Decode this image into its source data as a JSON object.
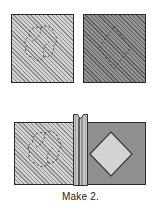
{
  "figure": {
    "caption": "Make 2.",
    "units": [
      {
        "id": "top-left-square",
        "name": "light-hatched-square-with-dashed-blob",
        "fabric": "light-hatched",
        "marking": "dashed-rounded-applique-placement-line",
        "position": {
          "x": 11,
          "y": 14,
          "w": 63,
          "h": 69
        }
      },
      {
        "id": "top-right-square",
        "name": "dark-hatched-square-with-dashed-diamond",
        "fabric": "dark-hatched",
        "marking": "dashed-diamond-placement-line",
        "position": {
          "x": 83,
          "y": 14,
          "w": 63,
          "h": 69
        }
      },
      {
        "id": "joined-unit",
        "name": "joined-two-square-unit-with-center-seam",
        "fabric_left": "light-hatched",
        "fabric_right": "solid-medium-gray",
        "marking_left": "dashed-rounded-applique-placement-line",
        "marking_right": "light-gray-diamond-applique",
        "position": {
          "x": 14,
          "y": 122,
          "w": 132,
          "h": 63
        }
      }
    ]
  },
  "colors": {
    "background": "#ffffff",
    "outline": "#2a2a2a",
    "fabric_light_base": "#b9b9b9",
    "fabric_light_hatch": "#8c8c8c",
    "fabric_dark_base": "#7d7d7d",
    "fabric_dark_hatch": "#5f5f5f",
    "fabric_solid": "#8f8f8f",
    "diamond_fill": "#d4d4d4",
    "seam_fill": "#c4c4c4",
    "dashed_marking": "#4a4a4a",
    "caption_text": "#1b1b1b"
  },
  "labels": {
    "top_left_square": "Light hatched square",
    "top_right_square": "Dark hatched square",
    "joined_unit": "Joined unit",
    "center_seam": "Center seam allowance",
    "diamond_applique": "Diamond applique",
    "blob_marking": "Applique placement marking"
  }
}
